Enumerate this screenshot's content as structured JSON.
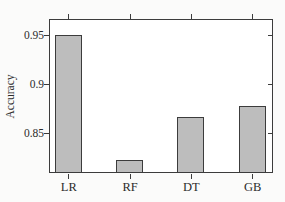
{
  "chart_data": {
    "type": "bar",
    "title": "",
    "xlabel": "",
    "ylabel": "Accuracy",
    "categories": [
      "LR",
      "RF",
      "DT",
      "GB"
    ],
    "values": [
      0.95,
      0.822,
      0.866,
      0.877
    ],
    "ylim": [
      0.81,
      0.965
    ],
    "yticks": [
      0.95,
      0.9,
      0.85
    ],
    "ytick_labels": [
      "0.95",
      "0.9",
      "0.85"
    ],
    "grid": false,
    "legend": null,
    "colors": {
      "bar_fill": "#bdbdbd",
      "bar_border": "#3c3c3c",
      "frame": "#3c3c3c",
      "plot_background": "#ffffff",
      "page_background": "#fbfbfa",
      "text": "#2c2c2c"
    }
  }
}
